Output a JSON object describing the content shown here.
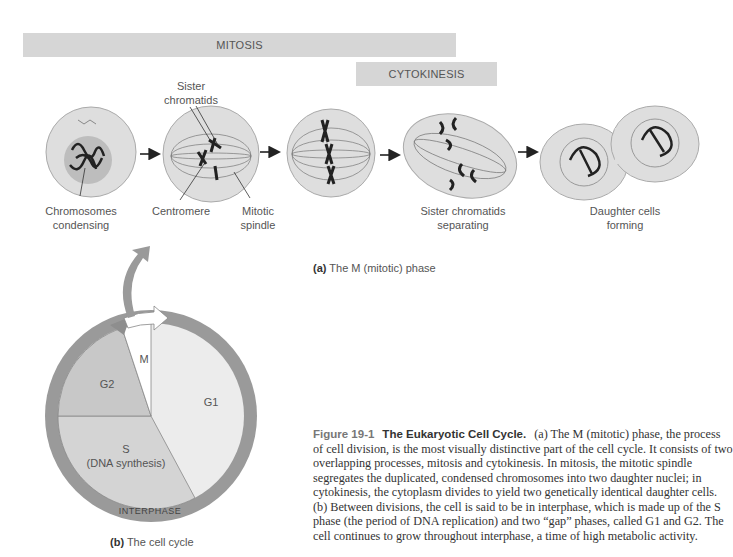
{
  "bars": {
    "mitosis": "MITOSIS",
    "cytokinesis": "CYTOKINESIS"
  },
  "panel_a": {
    "labels": {
      "sister_chromatids": "Sister chromatids",
      "sister_chromatids_l1": "Sister",
      "sister_chromatids_l2": "chromatids",
      "chromosomes_l1": "Chromosomes",
      "chromosomes_l2": "condensing",
      "centromere": "Centromere",
      "spindle_l1": "Mitotic",
      "spindle_l2": "spindle",
      "separating_l1": "Sister chromatids",
      "separating_l2": "separating",
      "daughter_l1": "Daughter cells",
      "daughter_l2": "forming"
    },
    "caption_bold": "(a)",
    "caption_text": " The M (mitotic) phase"
  },
  "panel_b": {
    "segments": {
      "m": "M",
      "g2": "G2",
      "g1": "G1",
      "s_l1": "S",
      "s_l2": "(DNA synthesis)"
    },
    "ring_label": "INTERPHASE",
    "caption_bold": "(b)",
    "caption_text": " The cell cycle"
  },
  "figure": {
    "number": "Figure 19-1",
    "title": "The Eukaryotic Cell Cycle.",
    "body": "(a) The M (mitotic) phase, the process of cell division, is the most visually distinctive part of the cell cycle. It consists of two overlapping processes, mitosis and cytokinesis. In mitosis, the mitotic spindle segregates the duplicated, condensed chromosomes into two daughter nuclei; in cytokinesis, the cytoplasm divides to yield two genetically identical daughter cells. (b) Between divisions, the cell is said to be in interphase, which is made up of the S phase (the period of DNA replication) and two “gap” phases, called G1 and G2. The cell continues to grow throughout interphase, a time of high metabolic activity."
  },
  "colors": {
    "bar": "#d6d6d6",
    "ring": "#9a9a9a",
    "g2": "#c8c8c8",
    "s": "#d4d4d4",
    "g1": "#ececec",
    "m": "#ffffff",
    "cell": "#dcdcdc",
    "chromosome": "#222222"
  }
}
